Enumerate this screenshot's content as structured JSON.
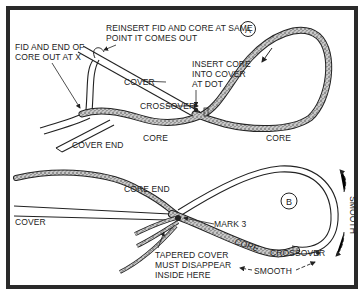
{
  "diagram": {
    "panel_a": {
      "badge": "A",
      "labels": {
        "reinsert_line1": "REINSERT FID AND CORE AT SAME",
        "reinsert_line2": "POINT IT COMES OUT",
        "fid_line1": "FID AND END OF",
        "fid_line2": "CORE OUT AT X",
        "insert_line1": "INSERT CORE",
        "insert_line2": "INTO COVER",
        "insert_line3": "AT DOT",
        "cover": "COVER",
        "crossover": "CROSSOVER",
        "core_left": "CORE",
        "core_right": "CORE",
        "cover_end": "COVER END"
      }
    },
    "panel_b": {
      "badge": "B",
      "labels": {
        "core_end": "CORE END",
        "cover": "COVER",
        "mark3": "MARK 3",
        "tapered_line1": "TAPERED COVER",
        "tapered_line2": "MUST DISAPPEAR",
        "tapered_line3": "INSIDE HERE",
        "core": "CORE",
        "crossover": "CROSSOVER",
        "smooth_bottom": "SMOOTH",
        "smooth_right": "SMOOTH"
      }
    }
  }
}
